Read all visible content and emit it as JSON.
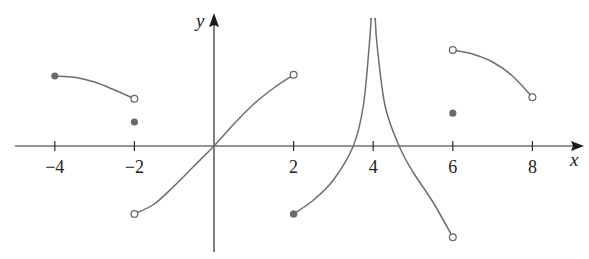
{
  "chart_data": {
    "type": "line",
    "title": "",
    "xlabel": "x",
    "ylabel": "y",
    "xlim": [
      -5,
      9.2
    ],
    "ylim": [
      -2.7,
      3.3
    ],
    "grid": false,
    "legend": null,
    "x_ticks": [
      -4,
      -2,
      2,
      4,
      6,
      8
    ],
    "x_tick_labels": [
      "−4",
      "−2",
      "2",
      "4",
      "6",
      "8"
    ],
    "vertical_asymptote": 4,
    "pieces": [
      {
        "name": "piece-1",
        "x_range": [
          -4,
          -2
        ],
        "points": [
          [
            -4,
            1.75
          ],
          [
            -3.5,
            1.72
          ],
          [
            -3,
            1.6
          ],
          [
            -2.5,
            1.4
          ],
          [
            -2,
            1.18
          ]
        ],
        "left_end": "closed",
        "right_end": "open"
      },
      {
        "name": "piece-2",
        "x_range": [
          -2,
          2
        ],
        "points": [
          [
            -2,
            -1.7
          ],
          [
            -1.5,
            -1.45
          ],
          [
            -1,
            -1.0
          ],
          [
            -0.5,
            -0.5
          ],
          [
            0,
            0
          ],
          [
            0.5,
            0.55
          ],
          [
            1,
            1.05
          ],
          [
            1.5,
            1.45
          ],
          [
            2,
            1.78
          ]
        ],
        "left_end": "open",
        "right_end": "open"
      },
      {
        "name": "piece-3",
        "x_range": [
          2,
          4
        ],
        "points": [
          [
            2,
            -1.7
          ],
          [
            2.5,
            -1.35
          ],
          [
            3,
            -0.85
          ],
          [
            3.5,
            0.0
          ],
          [
            3.75,
            1.0
          ],
          [
            3.9,
            2.5
          ],
          [
            3.95,
            3.2
          ]
        ],
        "left_end": "closed",
        "right_end": "asymptote"
      },
      {
        "name": "piece-4",
        "x_range": [
          4,
          6
        ],
        "points": [
          [
            4.05,
            3.2
          ],
          [
            4.1,
            2.5
          ],
          [
            4.3,
            1.0
          ],
          [
            4.65,
            0.0
          ],
          [
            5,
            -0.65
          ],
          [
            5.5,
            -1.4
          ],
          [
            6,
            -2.28
          ]
        ],
        "left_end": "asymptote",
        "right_end": "open"
      },
      {
        "name": "piece-5",
        "x_range": [
          6,
          8
        ],
        "points": [
          [
            6,
            2.4
          ],
          [
            6.5,
            2.3
          ],
          [
            7,
            2.1
          ],
          [
            7.5,
            1.75
          ],
          [
            8,
            1.22
          ]
        ],
        "left_end": "open",
        "right_end": "open"
      }
    ],
    "isolated_points": [
      {
        "x": -2,
        "y": 0.6
      },
      {
        "x": 2,
        "y": -1.7
      },
      {
        "x": 6,
        "y": 0.82
      }
    ]
  },
  "axes": {
    "x_label": "x",
    "y_label": "y",
    "tick_labels": [
      "−4",
      "−2",
      "2",
      "4",
      "6",
      "8"
    ]
  }
}
